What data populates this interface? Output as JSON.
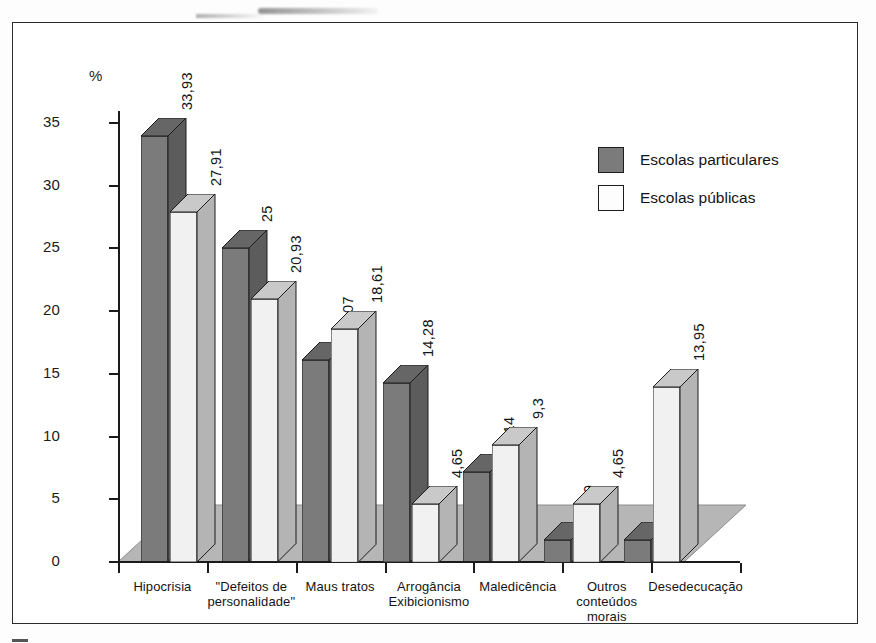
{
  "chart_data": {
    "type": "bar",
    "title": "",
    "subtitle": "",
    "xlabel": "",
    "ylabel": "%",
    "ylim": [
      0,
      35
    ],
    "yticks": [
      0,
      5,
      10,
      15,
      20,
      25,
      30,
      35
    ],
    "ytick_labels": [
      "0",
      "5",
      "10",
      "15",
      "20",
      "25",
      "30",
      "35"
    ],
    "grid": false,
    "legend_position": "top-right",
    "style": "3d-grouped-bar",
    "decimal_separator": ",",
    "categories": [
      "Hipocrisia",
      "\"Defeitos de personalidade\"",
      "Maus tratos",
      "Arrogância Exibicionismo",
      "Maledicência",
      "Outros conteúdos morais",
      "Desedecucação"
    ],
    "category_lines": [
      [
        "Hipocrisia"
      ],
      [
        "\"Defeitos de",
        "personalidade\""
      ],
      [
        "Maus tratos"
      ],
      [
        "Arrogância",
        "Exibicionismo"
      ],
      [
        "Maledicência"
      ],
      [
        "Outros",
        "conteúdos",
        "morais"
      ],
      [
        "Desedecucação"
      ]
    ],
    "series": [
      {
        "name": "Escolas particulares",
        "color": "#7b7b7b",
        "values": [
          33.93,
          25,
          16.07,
          14.28,
          7.14,
          1.79,
          1.79
        ],
        "labels": [
          "33,93",
          "25",
          "16,07",
          "14,28",
          "7,14",
          "1,79",
          "1,79"
        ]
      },
      {
        "name": "Escolas públicas",
        "color": "#f1f1f1",
        "values": [
          27.91,
          20.93,
          18.61,
          4.65,
          9.3,
          4.65,
          13.95
        ],
        "labels": [
          "27,91",
          "20,93",
          "18,61",
          "4,65",
          "9,3",
          "4,65",
          "13,95"
        ]
      }
    ]
  },
  "legend": {
    "items": [
      {
        "label": "Escolas particulares",
        "swatch": "dark"
      },
      {
        "label": "Escolas públicas",
        "swatch": "light"
      }
    ]
  },
  "colors": {
    "bar_dark": "#7b7b7b",
    "bar_light": "#f1f1f1",
    "bar_dark_top": "#666666",
    "bar_dark_side": "#5c5c5c",
    "bar_light_top": "#c9c9c9",
    "bar_light_side": "#b4b4b4",
    "floor": "#b6b6b6",
    "outline": "#1c1c1c",
    "frame": "#2b2b2b",
    "text": "#141414"
  }
}
